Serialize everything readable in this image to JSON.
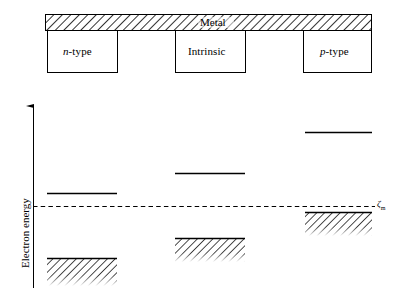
{
  "figure": {
    "title_text": "",
    "background_color": "#ffffff",
    "line_color": "#000000"
  },
  "structure_diagram": {
    "metal_bar": {
      "label": "Metal",
      "fill_pattern": "diagonal-hatch",
      "x": 45,
      "y": 14,
      "width": 327,
      "height": 17
    },
    "regions": [
      {
        "label_italic": "n",
        "label_roman": "-type",
        "label_full": "n-type",
        "x": 47,
        "y": 31,
        "width": 71,
        "height": 42
      },
      {
        "label_italic": "",
        "label_roman": "Intrinsic",
        "label_full": "Intrinsic",
        "x": 175,
        "y": 31,
        "width": 71,
        "height": 42
      },
      {
        "label_italic": "p",
        "label_roman": "-type",
        "label_full": "p-type",
        "x": 303,
        "y": 31,
        "width": 69,
        "height": 42
      }
    ]
  },
  "band_diagram": {
    "y_axis": {
      "label": "Electron energy",
      "arrow_direction": "up",
      "x": 33,
      "top_y": 103,
      "bottom_y": 288
    },
    "fermi_level": {
      "symbol": "ζ",
      "subscript": "m",
      "label": "ζm",
      "style": "dashed",
      "y": 206,
      "x_start": 33,
      "x_end": 375
    },
    "columns": [
      {
        "name": "n-type",
        "x_start": 47,
        "x_end": 117,
        "conduction_band_y": 193,
        "valence_band_top_y": 258,
        "valence_band_bottom_y": 286,
        "valence_fill": "diagonal-hatch"
      },
      {
        "name": "intrinsic",
        "x_start": 175,
        "x_end": 245,
        "conduction_band_y": 173,
        "valence_band_top_y": 238,
        "valence_band_bottom_y": 262,
        "valence_fill": "diagonal-hatch"
      },
      {
        "name": "p-type",
        "x_start": 305,
        "x_end": 372,
        "conduction_band_y": 132,
        "valence_band_top_y": 212,
        "valence_band_bottom_y": 236,
        "valence_fill": "diagonal-hatch"
      }
    ]
  }
}
